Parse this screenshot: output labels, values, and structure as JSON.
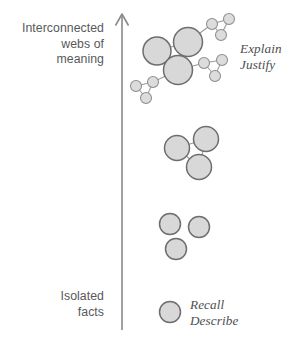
{
  "figure": {
    "background_color": "#ffffff"
  },
  "axis": {
    "name": "vertical-progression-arrow",
    "direction": "up",
    "color": "#8a8a8a",
    "x": 122,
    "y_top": 14,
    "y_bottom": 330,
    "top_label": "Interconnected\nwebs of\nmeaning",
    "bottom_label": "Isolated\nfacts",
    "label_color": "#59595a"
  },
  "annotations": {
    "top_verbs": "Explain\nJustify",
    "bottom_verbs": "Recall\nDescribe",
    "verb_color": "#4e4e4f"
  },
  "style": {
    "node_fill": "#d8d8d8",
    "node_stroke": "#6e6e6e",
    "edge_stroke": "#9a9a9a",
    "small_node_fill": "#dcdcdc",
    "small_node_stroke": "#8d8d8d"
  },
  "chart_data": {
    "type": "diagram",
    "ylabel": "Degree of interconnection",
    "ylim": [
      0,
      4
    ],
    "levels": [
      {
        "name": "isolated-fact",
        "level": 1,
        "axis_label": "Isolated facts",
        "verbs": [
          "Recall",
          "Describe"
        ],
        "node_count": 1,
        "edge_count": 0
      },
      {
        "name": "several-isolated-facts",
        "level": 2,
        "axis_label": "",
        "verbs": [],
        "node_count": 3,
        "edge_count": 0
      },
      {
        "name": "connected-triad",
        "level": 3,
        "axis_label": "",
        "verbs": [],
        "node_count": 3,
        "edge_count": 3
      },
      {
        "name": "interconnected-web",
        "level": 4,
        "axis_label": "Interconnected webs of meaning",
        "verbs": [
          "Explain",
          "Justify"
        ],
        "node_count": 12,
        "edge_count": 14
      }
    ]
  },
  "nodes": {
    "group_bottom": [
      {
        "id": "b1",
        "cx": 170,
        "cy": 312,
        "r": 10.5,
        "size": "medium"
      }
    ],
    "group_three_isolated": [
      {
        "id": "i1",
        "cx": 170,
        "cy": 224,
        "r": 10.5,
        "size": "medium"
      },
      {
        "id": "i2",
        "cx": 199,
        "cy": 227,
        "r": 10.5,
        "size": "medium"
      },
      {
        "id": "i3",
        "cx": 176,
        "cy": 249,
        "r": 10.5,
        "size": "medium"
      }
    ],
    "group_triangle": [
      {
        "id": "t1",
        "cx": 177,
        "cy": 148,
        "r": 12.5,
        "size": "large"
      },
      {
        "id": "t2",
        "cx": 206,
        "cy": 139,
        "r": 12.5,
        "size": "large"
      },
      {
        "id": "t3",
        "cx": 199,
        "cy": 167,
        "r": 12.5,
        "size": "large"
      }
    ],
    "group_web_hubs": [
      {
        "id": "h1",
        "cx": 157,
        "cy": 51,
        "r": 14,
        "size": "hub"
      },
      {
        "id": "h2",
        "cx": 188,
        "cy": 42,
        "r": 14.5,
        "size": "hub"
      },
      {
        "id": "h3",
        "cx": 178,
        "cy": 70,
        "r": 14.5,
        "size": "hub"
      }
    ],
    "group_web_satellites": [
      {
        "id": "s1",
        "cx": 212,
        "cy": 24,
        "r": 5.5,
        "size": "small"
      },
      {
        "id": "s2",
        "cx": 229,
        "cy": 19,
        "r": 5.5,
        "size": "small"
      },
      {
        "id": "s3",
        "cx": 221,
        "cy": 35,
        "r": 5.5,
        "size": "small"
      },
      {
        "id": "s4",
        "cx": 204,
        "cy": 63,
        "r": 5.5,
        "size": "small"
      },
      {
        "id": "s5",
        "cx": 222,
        "cy": 60,
        "r": 5.5,
        "size": "small"
      },
      {
        "id": "s6",
        "cx": 215,
        "cy": 76,
        "r": 5.5,
        "size": "small"
      },
      {
        "id": "s7",
        "cx": 153,
        "cy": 82,
        "r": 5.5,
        "size": "small"
      },
      {
        "id": "s8",
        "cx": 136,
        "cy": 86,
        "r": 5.5,
        "size": "small"
      },
      {
        "id": "s9",
        "cx": 146,
        "cy": 98,
        "r": 5.5,
        "size": "small"
      }
    ]
  },
  "edges": {
    "group_triangle": [
      {
        "from": "t1",
        "to": "t2"
      },
      {
        "from": "t2",
        "to": "t3"
      },
      {
        "from": "t1",
        "to": "t3"
      }
    ],
    "group_web": [
      {
        "from": "h1",
        "to": "h2"
      },
      {
        "from": "h2",
        "to": "h3"
      },
      {
        "from": "h1",
        "to": "h3"
      },
      {
        "from": "h2",
        "to": "s1"
      },
      {
        "from": "s1",
        "to": "s2"
      },
      {
        "from": "s2",
        "to": "s3"
      },
      {
        "from": "s1",
        "to": "s3"
      },
      {
        "from": "h3",
        "to": "s4"
      },
      {
        "from": "s4",
        "to": "s5"
      },
      {
        "from": "s5",
        "to": "s6"
      },
      {
        "from": "s4",
        "to": "s6"
      },
      {
        "from": "h3",
        "to": "s7"
      },
      {
        "from": "s7",
        "to": "s8"
      },
      {
        "from": "s8",
        "to": "s9"
      },
      {
        "from": "s7",
        "to": "s9"
      }
    ]
  }
}
